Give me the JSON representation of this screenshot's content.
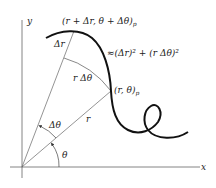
{
  "diagram": {
    "type": "polar arc length element",
    "axes": {
      "x_label": "x",
      "y_label": "y"
    },
    "labels": {
      "point_upper": "(r + Δr, θ + Δθ)",
      "point_upper_sub": "p",
      "point_lower": "(r, θ)",
      "point_lower_sub": "p",
      "delta_r": "Δr",
      "r_delta_theta": "r Δθ",
      "arc_length_expr": "≈(Δr)² + (r Δθ)²",
      "radius": "r",
      "delta_theta": "Δθ",
      "theta": "θ"
    },
    "colors": {
      "curve": "#111111",
      "lines": "#555555",
      "text": "#222222",
      "background": "#ffffff"
    }
  }
}
